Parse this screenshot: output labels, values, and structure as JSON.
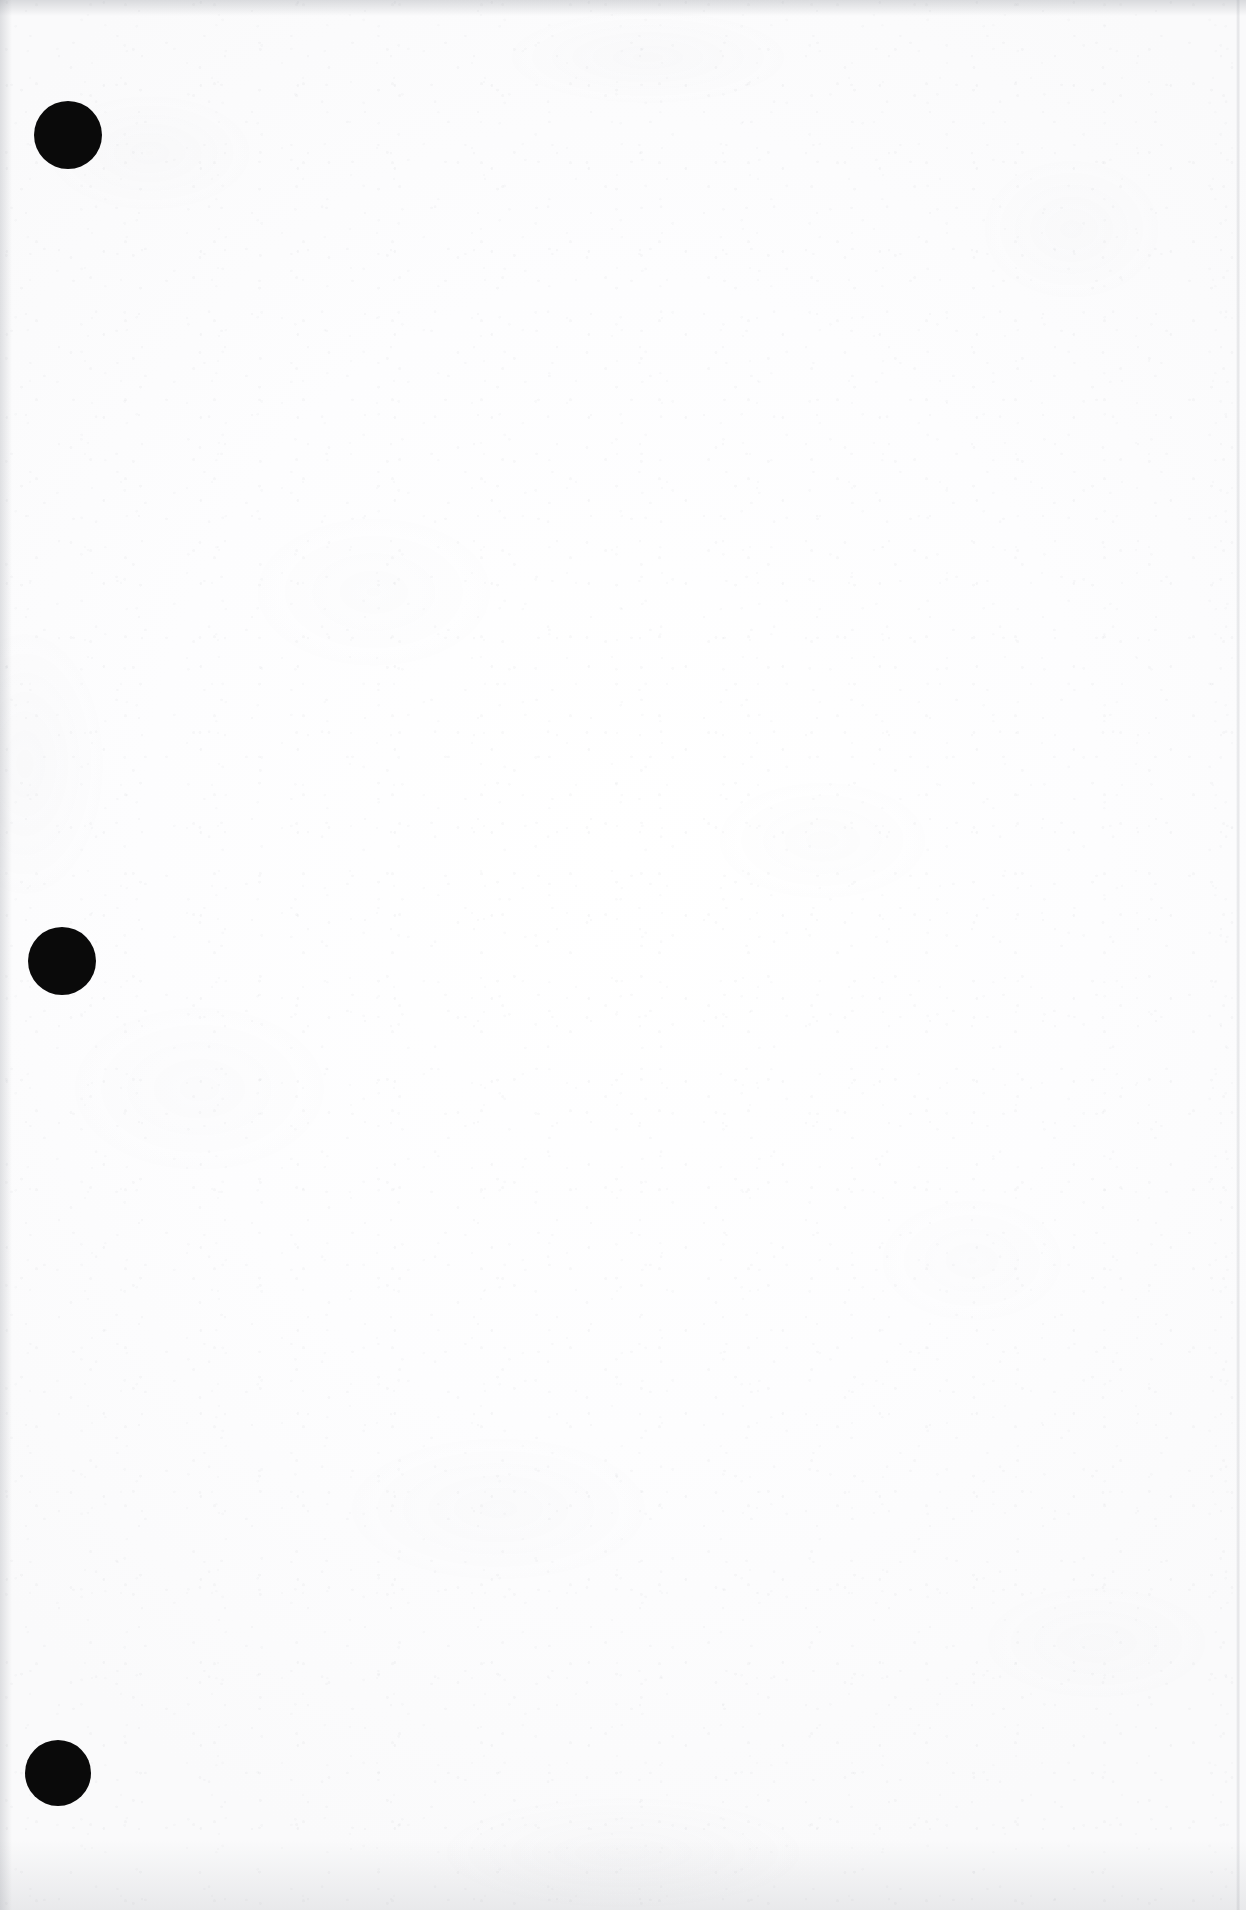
{
  "document": {
    "title": "Scanned blank page",
    "page_kind": "blank-scanned-sheet",
    "background_color": "#fdfdfd",
    "ink_color": "#0a0a0a",
    "width_px": 1246,
    "height_px": 1910,
    "body_text": "",
    "visible_text_content": ""
  },
  "marks": {
    "hole_punches": [
      {
        "label": "top hole punch",
        "cx": 68,
        "cy": 135,
        "r": 34,
        "color": "#0a0a0a"
      },
      {
        "label": "middle hole punch",
        "cx": 62,
        "cy": 961,
        "r": 34,
        "color": "#0a0a0a"
      },
      {
        "label": "bottom hole punch",
        "cx": 58,
        "cy": 1773,
        "r": 33,
        "color": "#0a0a0a"
      }
    ]
  },
  "scan_artifacts": {
    "top_edge_shadow": "#8c9098",
    "left_edge_shadow": "#8c9098",
    "bottom_edge_shadow": "#8c9098",
    "right_edge_line_x": 1236,
    "speckle_color": "#787d87"
  }
}
